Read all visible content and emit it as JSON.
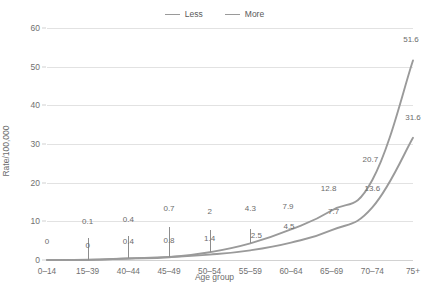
{
  "legend": {
    "position": "top-center",
    "items": [
      {
        "label": "Less",
        "color": "#9a9a9a"
      },
      {
        "label": "More",
        "color": "#9a9a9a"
      }
    ]
  },
  "axes": {
    "ylabel": "Rate/100,000",
    "xlabel": "Age group",
    "yticks": [
      "0",
      "10",
      "20",
      "30",
      "40",
      "50",
      "60"
    ],
    "xticks": [
      "0–14",
      "15–39",
      "40–44",
      "45–49",
      "50–54",
      "55–59",
      "60–64",
      "65–69",
      "70–74",
      "75+"
    ]
  },
  "chart_data": {
    "type": "line",
    "title": "",
    "xlabel": "Age group",
    "ylabel": "Rate/100,000",
    "ylim": [
      0,
      60
    ],
    "ytick_step": 10,
    "grid": true,
    "legend_position": "top-center",
    "categories": [
      "0–14",
      "15–39",
      "40–44",
      "45–49",
      "50–54",
      "55–59",
      "60–64",
      "65–69",
      "70–74",
      "75+"
    ],
    "series": [
      {
        "name": "More",
        "color": "#9a9a9a",
        "values": [
          0,
          0.1,
          0.4,
          0.7,
          2,
          4.3,
          7.9,
          12.8,
          20.7,
          51.6
        ],
        "labels": [
          "0",
          "0.1",
          "0.4",
          "0.7",
          "2",
          "4.3",
          "7.9",
          "12.8",
          "20.7",
          "51.6"
        ]
      },
      {
        "name": "Less",
        "color": "#9a9a9a",
        "values": [
          0,
          0,
          0.4,
          0.8,
          1.4,
          2.5,
          4.5,
          7.7,
          13.6,
          31.6
        ],
        "labels": [
          "0",
          "0",
          "0.4",
          "0.8",
          "1.4",
          "2.5",
          "4.5",
          "7.7",
          "13.6",
          "31.6"
        ]
      }
    ],
    "annotations": [
      {
        "text": "0",
        "series": "More",
        "category": "0–14"
      },
      {
        "text": "0.1",
        "series": "More",
        "category": "15–39"
      },
      {
        "text": "0",
        "series": "Less",
        "category": "15–39"
      },
      {
        "text": "0.4",
        "series": "More",
        "category": "40–44"
      },
      {
        "text": "0.4",
        "series": "Less",
        "category": "40–44"
      },
      {
        "text": "0.7",
        "series": "More",
        "category": "45–49"
      },
      {
        "text": "0.8",
        "series": "Less",
        "category": "45–49"
      },
      {
        "text": "2",
        "series": "More",
        "category": "50–54"
      },
      {
        "text": "1.4",
        "series": "Less",
        "category": "50–54"
      },
      {
        "text": "4.3",
        "series": "More",
        "category": "55–59"
      },
      {
        "text": "2.5",
        "series": "Less",
        "category": "55–59"
      },
      {
        "text": "7.9",
        "series": "More",
        "category": "60–64"
      },
      {
        "text": "4.5",
        "series": "Less",
        "category": "60–64"
      },
      {
        "text": "12.8",
        "series": "More",
        "category": "65–69"
      },
      {
        "text": "7.7",
        "series": "Less",
        "category": "65–69"
      },
      {
        "text": "20.7",
        "series": "More",
        "category": "70–74"
      },
      {
        "text": "13.6",
        "series": "Less",
        "category": "70–74"
      },
      {
        "text": "51.6",
        "series": "More",
        "category": "75+"
      },
      {
        "text": "31.6",
        "series": "Less",
        "category": "75+"
      }
    ]
  }
}
